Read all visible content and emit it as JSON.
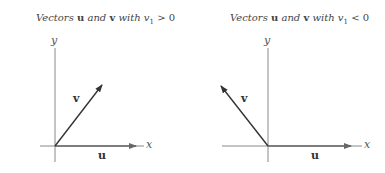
{
  "panels": [
    {
      "title_prefix": "Vectors",
      "title_u": "u",
      "title_and": "and",
      "title_v": "v",
      "title_with": "with",
      "title_cond": "v",
      "title_sub": "1",
      "title_rel": "> 0",
      "x_label": "x",
      "y_label": "y",
      "u_label": "u",
      "v_label": "v"
    },
    {
      "title_prefix": "Vectors",
      "title_u": "u",
      "title_and": "and",
      "title_v": "v",
      "title_with": "with",
      "title_cond": "v",
      "title_sub": "1",
      "title_rel": "< 0",
      "x_label": "x",
      "y_label": "y",
      "u_label": "u",
      "v_label": "v"
    }
  ],
  "colors": {
    "axis": "#888888",
    "vector": "#333333",
    "text": "#444444"
  }
}
